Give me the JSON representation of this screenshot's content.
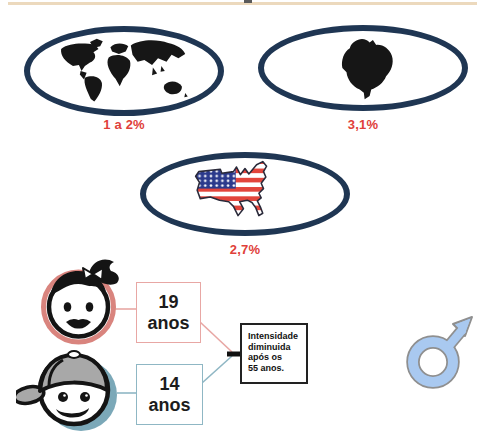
{
  "figure": {
    "top_rule_color": "#ecd9bd",
    "prevalence": [
      {
        "region": "world",
        "label": "1 a 2%"
      },
      {
        "region": "brazil",
        "label": "3,1%"
      },
      {
        "region": "usa",
        "label": "2,7%"
      }
    ],
    "ages": [
      {
        "group": "girl",
        "value": "19",
        "unit": "anos"
      },
      {
        "group": "boy",
        "value": "14",
        "unit": "anos"
      }
    ],
    "note_lines": [
      "Intensidade",
      "diminuida",
      "após os",
      "55 anos."
    ],
    "icons": {
      "male_symbol_glyph": "♂",
      "maps": [
        "world-map",
        "brazil-map",
        "usa-flag-map"
      ]
    },
    "colors": {
      "oval_border": "#1f3653",
      "label_red": "#e0403a",
      "girl_ring": "#d9847e",
      "boy_ring": "#7ba8b8",
      "girl_box_border": "#e8a7a4",
      "boy_box_border": "#8fb7c4",
      "flag_red": "#e2453c",
      "flag_blue": "#2b3a8c",
      "male_symbol_fill": "#a9c9f0"
    }
  }
}
